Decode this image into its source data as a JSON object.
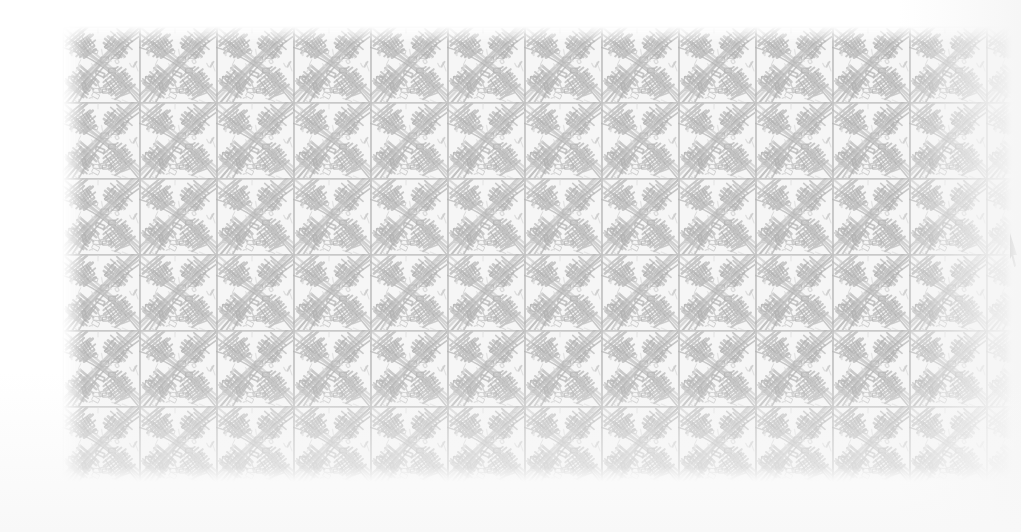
{
  "document": {
    "kind": "scanned-pattern-sheet",
    "title": "Hand-drawn crosshatch tile pattern",
    "description": "A scanned sheet showing a repeating grid of hand-drawn crosshatched square tiles in light pencil gray on white paper.",
    "page_background": "#ffffff"
  },
  "pattern": {
    "name": "crosshatch-basketweave-tile",
    "motif": "hand-drawn scribbled arcs and hatched bands inside square tiles",
    "tile_width_px": 77,
    "tile_height_px": 76,
    "columns": 13,
    "rows": 6,
    "block_left_px": 62,
    "block_top_px": 26,
    "block_width_px": 959,
    "block_height_px": 456,
    "stroke_color": "#c2c2c2",
    "stroke_color_light": "#d8d8d8",
    "stroke_color_dark": "#b0b0b0",
    "fill_color": "#f6f6f6",
    "tile_border_color": "#bdbdbd",
    "edge_fade": "soft gradient falloff on all four sides"
  },
  "cursor": {
    "name": "mouse-pointer-sliver",
    "visible": true,
    "x_px": 1010,
    "y_px": 233,
    "width_px": 9,
    "height_px": 36,
    "color": "#111111",
    "note": "partially clipped dark pointer at the right screen edge"
  },
  "colors": {
    "paper": "#ffffff",
    "ink": "#c2c2c2",
    "ink_dark": "#b0b0b0",
    "ink_light": "#e2e2e2",
    "shadow": "#f6f6f6"
  }
}
